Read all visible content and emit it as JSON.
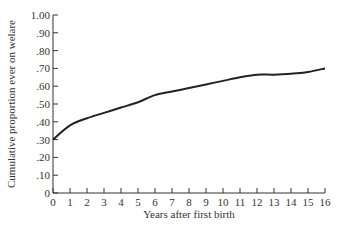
{
  "chart_data": {
    "type": "line",
    "title": "",
    "xlabel": "Years after first birth",
    "ylabel": "Cumulative proportion ever on welare",
    "xlim": [
      0,
      16
    ],
    "ylim": [
      0,
      1.0
    ],
    "x_ticks": [
      "0",
      "1",
      "2",
      "3",
      "4",
      "5",
      "6",
      "7",
      "8",
      "9",
      "10",
      "11",
      "12",
      "13",
      "14",
      "15",
      "16"
    ],
    "y_ticks": [
      "0",
      ".10",
      ".20",
      ".30",
      ".40",
      ".50",
      ".60",
      ".70",
      ".80",
      ".90",
      "1.00"
    ],
    "grid": false,
    "legend": null,
    "x": [
      0,
      1,
      2,
      3,
      4,
      5,
      6,
      7,
      8,
      9,
      10,
      11,
      12,
      13,
      14,
      15,
      16
    ],
    "series": [
      {
        "name": "Cumulative proportion ever on welfare",
        "values": [
          0.3,
          0.38,
          0.42,
          0.45,
          0.48,
          0.51,
          0.55,
          0.57,
          0.59,
          0.61,
          0.63,
          0.65,
          0.665,
          0.665,
          0.67,
          0.68,
          0.7
        ],
        "color": "#222222"
      }
    ]
  }
}
